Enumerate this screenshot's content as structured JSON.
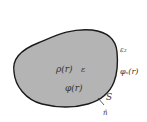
{
  "diagram": {
    "region": {
      "fill": "#b4b4b4",
      "stroke": "#1a1a1a"
    },
    "labels": {
      "charge_density": "ρ(r)",
      "permittivity_inside": "ε",
      "potential": "φ(r)",
      "permittivity_outside": "ε₂",
      "surface_potential": "φₛ(r)",
      "surface": "S",
      "normal": "n̂"
    }
  }
}
